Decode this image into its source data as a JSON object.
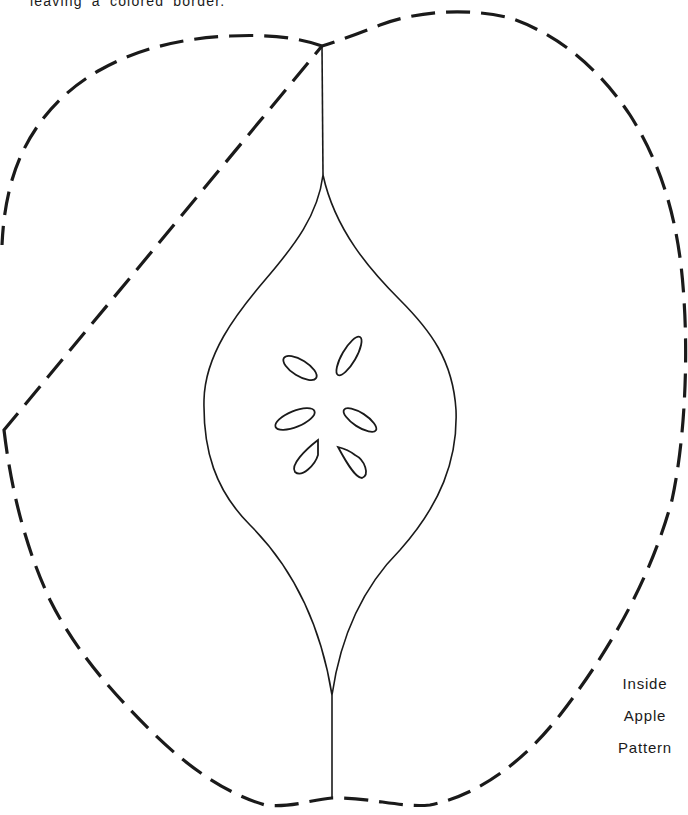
{
  "page": {
    "caption_fragment": "leaving a colored border.",
    "label": {
      "line1": "Inside",
      "line2": "Apple",
      "line3": "Pattern"
    }
  },
  "pattern": {
    "name": "inside-apple",
    "outline_style": "dashed",
    "seed_count": 6,
    "ink_color": "#1a1a1a"
  }
}
